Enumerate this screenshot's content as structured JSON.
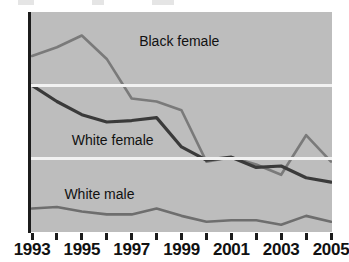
{
  "chart_data": {
    "type": "line",
    "title": "",
    "subtitle": "",
    "xlabel": "",
    "ylabel": "",
    "x": [
      1993,
      1994,
      1995,
      1996,
      1997,
      1998,
      1999,
      2000,
      2001,
      2002,
      2003,
      2004,
      2005
    ],
    "xtick_labels": [
      "1993",
      "",
      "1995",
      "",
      "1997",
      "",
      "1999",
      "",
      "2001",
      "",
      "2003",
      "",
      "2005"
    ],
    "xlim": [
      1993,
      2005
    ],
    "ylim": [
      0,
      15
    ],
    "yticks": [
      0,
      5,
      10,
      15
    ],
    "ytick_labels": [
      "0",
      "5",
      "10",
      "15"
    ],
    "grid": "horizontal-white-at-5-and-10",
    "legend": "inline-annotations",
    "plot_background": "#bdbdbd",
    "series": [
      {
        "name": "Black female",
        "color": "#7a7a7a",
        "values": [
          12.0,
          12.6,
          13.4,
          11.8,
          9.1,
          8.9,
          8.3,
          4.8,
          5.1,
          4.6,
          3.9,
          6.6,
          4.8
        ]
      },
      {
        "name": "White female",
        "color": "#3a3a3a",
        "values": [
          10.0,
          8.9,
          8.0,
          7.5,
          7.6,
          7.8,
          5.8,
          4.9,
          5.1,
          4.4,
          4.5,
          3.7,
          3.4
        ]
      },
      {
        "name": "White male",
        "color": "#6e6e6e",
        "values": [
          1.6,
          1.7,
          1.4,
          1.2,
          1.2,
          1.6,
          1.1,
          0.7,
          0.8,
          0.8,
          0.5,
          1.1,
          0.7
        ]
      }
    ],
    "annotations": [
      {
        "text": "Black female",
        "x": 1997.3,
        "y": 13.0
      },
      {
        "text": "White female",
        "x": 1994.6,
        "y": 6.3
      },
      {
        "text": "White male",
        "x": 1994.3,
        "y": 2.6
      }
    ]
  },
  "axis": {
    "y_labels": [
      "15",
      "10",
      "5",
      "0"
    ],
    "x_labels": [
      "1993",
      "1995",
      "1997",
      "1999",
      "2001",
      "2003",
      "2005"
    ]
  }
}
